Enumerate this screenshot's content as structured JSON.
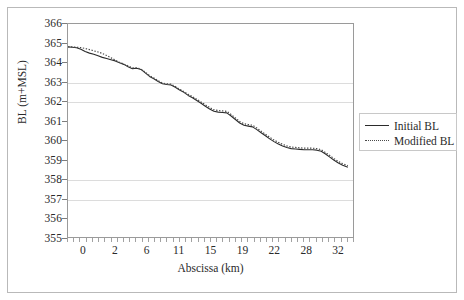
{
  "chart_data": {
    "type": "line",
    "title": "",
    "xlabel": "Abscissa (km)",
    "ylabel": "BL (m+MSL)",
    "xlim": [
      0,
      33.2
    ],
    "ylim": [
      355,
      366
    ],
    "grid": true,
    "legend_position": "right",
    "y_ticks": [
      366,
      365,
      364,
      363,
      362,
      361,
      360,
      359,
      358,
      357,
      356,
      355
    ],
    "x_ticks": [
      0,
      2,
      6,
      11,
      15,
      19,
      22,
      28,
      32
    ],
    "x_tick_positions": [
      0,
      2,
      6,
      11,
      15,
      19,
      22,
      28,
      32
    ],
    "x_minor_tick_count": 46,
    "gridline_values": [
      363,
      362,
      358,
      357
    ],
    "series": [
      {
        "name": "Initial BL",
        "style": "solid",
        "color": "#2b2b2b",
        "x": [
          0.0,
          0.5,
          1.0,
          1.5,
          2.0,
          2.5,
          3.0,
          3.5,
          4.0,
          4.5,
          5.0,
          5.5,
          6.0,
          6.5,
          7.0,
          7.5,
          8.0,
          8.5,
          9.0,
          9.5,
          10.0,
          10.5,
          11.0,
          11.5,
          12.0,
          12.5,
          13.0,
          13.5,
          14.0,
          14.5,
          15.0,
          15.5,
          16.0,
          16.5,
          17.0,
          17.5,
          18.0,
          18.5,
          19.0,
          19.5,
          20.0,
          20.5,
          21.0,
          21.5,
          22.0,
          22.5,
          23.0,
          23.5,
          24.0,
          24.5,
          25.0,
          25.5,
          26.0,
          26.5,
          27.0,
          27.5,
          28.0,
          28.5,
          29.0,
          29.5,
          30.0,
          30.5,
          31.0,
          31.5,
          32.0,
          32.6
        ],
        "y": [
          364.82,
          364.8,
          364.78,
          364.7,
          364.58,
          364.5,
          364.44,
          364.36,
          364.28,
          364.22,
          364.16,
          364.1,
          364.0,
          363.92,
          363.8,
          363.7,
          363.72,
          363.66,
          363.48,
          363.3,
          363.18,
          363.04,
          362.92,
          362.88,
          362.86,
          362.74,
          362.6,
          362.48,
          362.32,
          362.2,
          362.06,
          361.92,
          361.76,
          361.62,
          361.5,
          361.46,
          361.44,
          361.42,
          361.26,
          361.08,
          360.9,
          360.78,
          360.74,
          360.7,
          360.56,
          360.4,
          360.24,
          360.08,
          359.94,
          359.82,
          359.72,
          359.64,
          359.58,
          359.56,
          359.54,
          359.52,
          359.52,
          359.52,
          359.5,
          359.44,
          359.3,
          359.14,
          358.98,
          358.84,
          358.72,
          358.62
        ]
      },
      {
        "name": "Modified BL",
        "style": "dotted",
        "color": "#4a4a4a",
        "x": [
          0.0,
          0.5,
          1.0,
          1.5,
          2.0,
          2.5,
          3.0,
          3.5,
          4.0,
          4.5,
          5.0,
          5.5,
          6.0,
          6.5,
          7.0,
          7.5,
          8.0,
          8.5,
          9.0,
          9.5,
          10.0,
          10.5,
          11.0,
          11.5,
          12.0,
          12.5,
          13.0,
          13.5,
          14.0,
          14.5,
          15.0,
          15.5,
          16.0,
          16.5,
          17.0,
          17.5,
          18.0,
          18.5,
          19.0,
          19.5,
          20.0,
          20.5,
          21.0,
          21.5,
          22.0,
          22.5,
          23.0,
          23.5,
          24.0,
          24.5,
          25.0,
          25.5,
          26.0,
          26.5,
          27.0,
          27.5,
          28.0,
          28.5,
          29.0,
          29.5,
          30.0,
          30.5,
          31.0,
          31.5,
          32.0,
          32.6
        ],
        "y": [
          364.82,
          364.82,
          364.8,
          364.78,
          364.74,
          364.68,
          364.62,
          364.56,
          364.48,
          364.38,
          364.26,
          364.14,
          364.02,
          363.94,
          363.84,
          363.74,
          363.74,
          363.68,
          363.52,
          363.34,
          363.22,
          363.08,
          362.96,
          362.92,
          362.9,
          362.78,
          362.64,
          362.52,
          362.38,
          362.26,
          362.12,
          361.98,
          361.84,
          361.7,
          361.58,
          361.54,
          361.52,
          361.5,
          361.34,
          361.16,
          360.98,
          360.86,
          360.82,
          360.78,
          360.64,
          360.48,
          360.32,
          360.16,
          360.02,
          359.9,
          359.8,
          359.72,
          359.66,
          359.64,
          359.62,
          359.6,
          359.6,
          359.6,
          359.58,
          359.52,
          359.38,
          359.22,
          359.06,
          358.92,
          358.8,
          358.7
        ]
      }
    ]
  },
  "legend": {
    "entries": [
      {
        "label": "Initial BL",
        "style": "solid"
      },
      {
        "label": "Modified BL",
        "style": "dotted"
      }
    ]
  }
}
